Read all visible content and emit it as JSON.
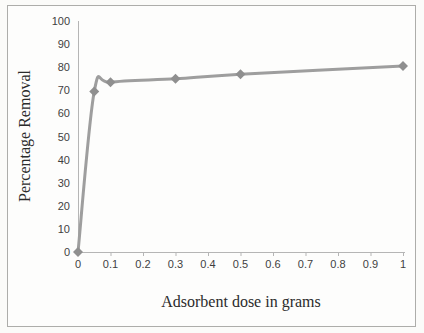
{
  "chart_data": {
    "type": "line",
    "title": "",
    "xlabel": "Adsorbent dose in grams",
    "ylabel": "Percentage Removal",
    "x": [
      0,
      0.05,
      0.1,
      0.3,
      0.5,
      1
    ],
    "values": [
      0,
      69.5,
      73.5,
      75,
      77,
      80.5
    ],
    "series": [
      {
        "name": "Percentage Removal",
        "x": [
          0,
          0.05,
          0.1,
          0.3,
          0.5,
          1
        ],
        "values": [
          0,
          69.5,
          73.5,
          75,
          77,
          80.5
        ]
      }
    ],
    "xlim": [
      0,
      1
    ],
    "ylim": [
      0,
      100
    ],
    "x_ticks": [
      0,
      0.1,
      0.2,
      0.3,
      0.4,
      0.5,
      0.6,
      0.7,
      0.8,
      0.9,
      1
    ],
    "x_tick_labels": [
      "0",
      "0.1",
      "0.2",
      "0.3",
      "0.4",
      "0.5",
      "0.6",
      "0.7",
      "0.8",
      "0.9",
      "1"
    ],
    "y_ticks": [
      0,
      10,
      20,
      30,
      40,
      50,
      60,
      70,
      80,
      90,
      100
    ],
    "y_tick_labels": [
      "0",
      "10",
      "20",
      "30",
      "40",
      "50",
      "60",
      "70",
      "80",
      "90",
      "100"
    ],
    "grid": false,
    "legend": "none",
    "marker": "diamond",
    "colors": {
      "line": "#9e9e9e",
      "marker": "#8f8f8f",
      "axis": "#b5b5b5",
      "tick_text": "#3f3f3f",
      "title_text": "#2b2b2b",
      "frame_border": "#adadaa",
      "background": "#fdfdfc"
    }
  }
}
